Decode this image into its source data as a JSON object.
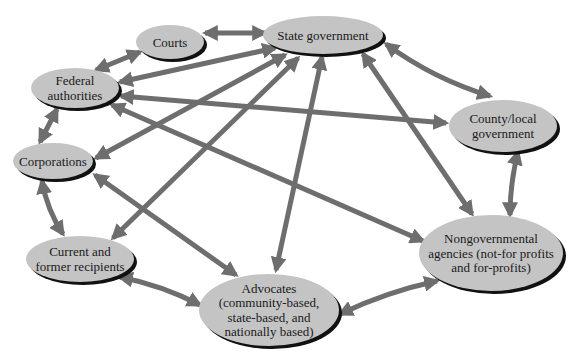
{
  "diagram": {
    "type": "network",
    "colors": {
      "node_fill": "#c4c4c4",
      "node_shadow": "#111111",
      "edge": "#6e6e6e",
      "text": "#1a1a1a",
      "background": "#ffffff"
    },
    "nodes": [
      {
        "id": "courts",
        "lines": [
          "Courts"
        ],
        "cx": 170,
        "cy": 42,
        "rx": 34,
        "ry": 17
      },
      {
        "id": "state",
        "lines": [
          "State government"
        ],
        "cx": 323,
        "cy": 35,
        "rx": 60,
        "ry": 19
      },
      {
        "id": "federal",
        "lines": [
          "Federal",
          "authorities"
        ],
        "cx": 75,
        "cy": 88,
        "rx": 44,
        "ry": 20
      },
      {
        "id": "county",
        "lines": [
          "County/local",
          "government"
        ],
        "cx": 503,
        "cy": 126,
        "rx": 54,
        "ry": 26
      },
      {
        "id": "corporations",
        "lines": [
          "Corporations"
        ],
        "cx": 53,
        "cy": 161,
        "rx": 40,
        "ry": 18
      },
      {
        "id": "recipients",
        "lines": [
          "Current and",
          "former recipients"
        ],
        "cx": 80,
        "cy": 259,
        "rx": 54,
        "ry": 23
      },
      {
        "id": "advocates",
        "lines": [
          "Advocates",
          "(community-based,",
          "state-based, and",
          "nationally based)"
        ],
        "cx": 269,
        "cy": 310,
        "rx": 70,
        "ry": 36
      },
      {
        "id": "ngo",
        "lines": [
          "Nongovernmental",
          "agencies (not-for profits",
          "and for-profits)"
        ],
        "cx": 491,
        "cy": 253,
        "rx": 72,
        "ry": 38
      }
    ],
    "edges": [
      {
        "from": "courts",
        "to": "state",
        "x1": 205,
        "y1": 33,
        "x2": 265,
        "y2": 33,
        "curve": 0
      },
      {
        "from": "courts",
        "to": "federal",
        "x1": 140,
        "y1": 52,
        "x2": 96,
        "y2": 70,
        "curve": 0
      },
      {
        "from": "state",
        "to": "federal",
        "x1": 275,
        "y1": 48,
        "x2": 120,
        "y2": 82,
        "curve": 0
      },
      {
        "from": "state",
        "to": "corporations",
        "x1": 285,
        "y1": 55,
        "x2": 96,
        "y2": 158,
        "curve": 0
      },
      {
        "from": "state",
        "to": "recipients",
        "x1": 298,
        "y1": 58,
        "x2": 113,
        "y2": 238,
        "curve": 0
      },
      {
        "from": "state",
        "to": "advocates",
        "x1": 322,
        "y1": 57,
        "x2": 276,
        "y2": 270,
        "curve": 0
      },
      {
        "from": "state",
        "to": "ngo",
        "x1": 363,
        "y1": 54,
        "x2": 472,
        "y2": 214,
        "curve": 0
      },
      {
        "from": "state",
        "to": "county",
        "x1": 386,
        "y1": 44,
        "x2": 490,
        "y2": 96,
        "curve": 10
      },
      {
        "from": "federal",
        "to": "county",
        "x1": 121,
        "y1": 96,
        "x2": 446,
        "y2": 123,
        "curve": 0
      },
      {
        "from": "federal",
        "to": "ngo",
        "x1": 112,
        "y1": 105,
        "x2": 423,
        "y2": 241,
        "curve": 0
      },
      {
        "from": "federal",
        "to": "corporations",
        "x1": 57,
        "y1": 109,
        "x2": 40,
        "y2": 142,
        "curve": 0
      },
      {
        "from": "corporations",
        "to": "advocates",
        "x1": 95,
        "y1": 175,
        "x2": 236,
        "y2": 275,
        "curve": 0
      },
      {
        "from": "corporations",
        "to": "recipients",
        "x1": 42,
        "y1": 181,
        "x2": 63,
        "y2": 234,
        "curve": 6
      },
      {
        "from": "recipients",
        "to": "advocates",
        "x1": 120,
        "y1": 277,
        "x2": 200,
        "y2": 305,
        "curve": -6
      },
      {
        "from": "advocates",
        "to": "ngo",
        "x1": 340,
        "y1": 314,
        "x2": 437,
        "y2": 281,
        "curve": -6
      },
      {
        "from": "county",
        "to": "ngo",
        "x1": 518,
        "y1": 152,
        "x2": 510,
        "y2": 215,
        "curve": 4
      }
    ]
  }
}
